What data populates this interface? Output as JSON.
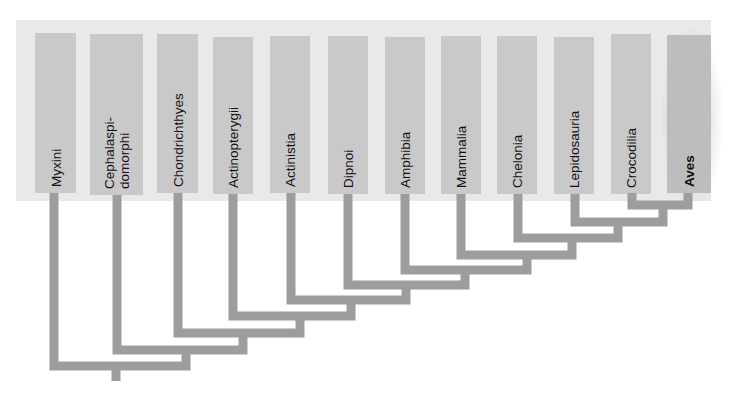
{
  "diagram": {
    "type": "cladogram",
    "colors": {
      "background": "#ffffff",
      "panel": "#e9e9e9",
      "taxon_box": "#c9c9c9",
      "branch": "#9d9d9d",
      "text": "#111111"
    },
    "taxa": [
      {
        "id": "myxini",
        "label": "Myxini",
        "bold": false
      },
      {
        "id": "cephalaspidomorphi",
        "label": "Cephalaspi-\ndomorphi",
        "bold": false
      },
      {
        "id": "chondrichthyes",
        "label": "Chondrichthyes",
        "bold": false
      },
      {
        "id": "actinopterygii",
        "label": "Actinopterygii",
        "bold": false
      },
      {
        "id": "actinistia",
        "label": "Actinistia",
        "bold": false
      },
      {
        "id": "dipnoi",
        "label": "Dipnoi",
        "bold": false
      },
      {
        "id": "amphibia",
        "label": "Amphibia",
        "bold": false
      },
      {
        "id": "mammalia",
        "label": "Mammalia",
        "bold": false
      },
      {
        "id": "chelonia",
        "label": "Chelonia",
        "bold": false
      },
      {
        "id": "lepidosauria",
        "label": "Lepidosauria",
        "bold": false
      },
      {
        "id": "crocodilia",
        "label": "Crocodilia",
        "bold": false
      },
      {
        "id": "aves",
        "label": "Aves",
        "bold": true
      }
    ],
    "tree": "(Myxini,(Cephalaspidomorphi,(Chondrichthyes,(Actinopterygii,(Actinistia,(Dipnoi,(Amphibia,(Mammalia,(Chelonia,(Lepidosauria,(Crocodilia,Aves)))))))))))",
    "highlighted_taxon": "Aves"
  }
}
